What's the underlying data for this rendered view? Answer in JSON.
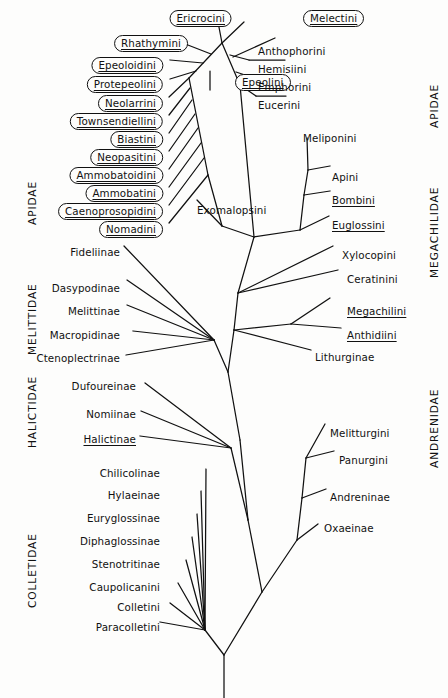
{
  "figure": {
    "type": "cladogram",
    "note": "Boxed names are cleptoparasitic / socially parasitic taxa; underlined names are taxa with social behaviour."
  },
  "families": {
    "left": [
      {
        "name": "APIDAE",
        "x": 26,
        "y": 225
      },
      {
        "name": "MELITTIDAE",
        "x": 26,
        "y": 355
      },
      {
        "name": "HALICTIDAE",
        "x": 26,
        "y": 448
      },
      {
        "name": "COLLETIDAE",
        "x": 26,
        "y": 608
      }
    ],
    "right": [
      {
        "name": "APIDAE",
        "x": 428,
        "y": 128
      },
      {
        "name": "MEGACHILIDAE",
        "x": 428,
        "y": 278
      },
      {
        "name": "ANDRENIDAE",
        "x": 428,
        "y": 468
      }
    ]
  },
  "boxed_taxa": [
    {
      "label": "Ericrocini",
      "x": 232,
      "y": 10,
      "underlined": true
    },
    {
      "label": "Melectini",
      "x": 303,
      "y": 10,
      "underlined": true,
      "align": "left"
    },
    {
      "label": "Rhathymini",
      "x": 188,
      "y": 35,
      "underlined": true
    },
    {
      "label": "Epeoloidini",
      "x": 163,
      "y": 57,
      "underlined": true
    },
    {
      "label": "Protepeolini",
      "x": 163,
      "y": 76,
      "underlined": true
    },
    {
      "label": "Epeolini",
      "x": 235,
      "y": 74,
      "underlined": true,
      "align": "left"
    },
    {
      "label": "Neolarrini",
      "x": 163,
      "y": 95,
      "underlined": true
    },
    {
      "label": "Townsendiellini",
      "x": 163,
      "y": 113,
      "underlined": true
    },
    {
      "label": "Biastini",
      "x": 163,
      "y": 131,
      "underlined": true
    },
    {
      "label": "Neopasitini",
      "x": 163,
      "y": 149,
      "underlined": true
    },
    {
      "label": "Ammobatoidini",
      "x": 163,
      "y": 167,
      "underlined": true
    },
    {
      "label": "Ammobatini",
      "x": 163,
      "y": 185,
      "underlined": true
    },
    {
      "label": "Caenoprosopidini",
      "x": 163,
      "y": 203,
      "underlined": true
    },
    {
      "label": "Nomadini",
      "x": 163,
      "y": 221,
      "underlined": true
    }
  ],
  "plain_taxa": [
    {
      "label": "Anthophorini",
      "x": 258,
      "y": 46,
      "align": "left",
      "underlined": false
    },
    {
      "label": "Hemisiini",
      "x": 258,
      "y": 64,
      "align": "left",
      "underlined": false
    },
    {
      "label": "Emphorini",
      "x": 258,
      "y": 82,
      "align": "left",
      "underlined": false
    },
    {
      "label": "Eucerini",
      "x": 258,
      "y": 100,
      "align": "left",
      "underlined": false
    },
    {
      "label": "Meliponini",
      "x": 303,
      "y": 133,
      "align": "left",
      "underlined": false
    },
    {
      "label": "Apini",
      "x": 332,
      "y": 172,
      "align": "left",
      "underlined": false
    },
    {
      "label": "Bombini",
      "x": 332,
      "y": 195,
      "align": "left",
      "underlined": true
    },
    {
      "label": "Euglossini",
      "x": 332,
      "y": 220,
      "align": "left",
      "underlined": true
    },
    {
      "label": "Exomalopsini",
      "x": 197,
      "y": 205,
      "align": "left",
      "underlined": false
    },
    {
      "label": "Xylocopini",
      "x": 342,
      "y": 250,
      "align": "left",
      "underlined": false
    },
    {
      "label": "Ceratinini",
      "x": 347,
      "y": 274,
      "align": "left",
      "underlined": false
    },
    {
      "label": "Megachilini",
      "x": 347,
      "y": 306,
      "align": "left",
      "underlined": true
    },
    {
      "label": "Anthidiini",
      "x": 347,
      "y": 330,
      "align": "left",
      "underlined": true
    },
    {
      "label": "Lithurginae",
      "x": 315,
      "y": 352,
      "align": "left",
      "underlined": false
    },
    {
      "label": "Fideliinae",
      "x": 120,
      "y": 247,
      "align": "right",
      "underlined": false
    },
    {
      "label": "Dasypodinae",
      "x": 120,
      "y": 283,
      "align": "right",
      "underlined": false
    },
    {
      "label": "Melittinae",
      "x": 120,
      "y": 306,
      "align": "right",
      "underlined": false
    },
    {
      "label": "Macropidinae",
      "x": 120,
      "y": 330,
      "align": "right",
      "underlined": false
    },
    {
      "label": "Ctenoplectrinae",
      "x": 120,
      "y": 353,
      "align": "right",
      "underlined": false
    },
    {
      "label": "Dufoureinae",
      "x": 136,
      "y": 381,
      "align": "right",
      "underlined": false
    },
    {
      "label": "Nomiinae",
      "x": 136,
      "y": 409,
      "align": "right",
      "underlined": false
    },
    {
      "label": "Halictinae",
      "x": 136,
      "y": 434,
      "align": "right",
      "underlined": true
    },
    {
      "label": "Chilicolinae",
      "x": 160,
      "y": 468,
      "align": "right",
      "underlined": false
    },
    {
      "label": "Hylaeinae",
      "x": 160,
      "y": 490,
      "align": "right",
      "underlined": false
    },
    {
      "label": "Euryglossinae",
      "x": 160,
      "y": 513,
      "align": "right",
      "underlined": false
    },
    {
      "label": "Diphaglossinae",
      "x": 160,
      "y": 536,
      "align": "right",
      "underlined": false
    },
    {
      "label": "Stenotritinae",
      "x": 160,
      "y": 559,
      "align": "right",
      "underlined": false
    },
    {
      "label": "Caupolicanini",
      "x": 160,
      "y": 582,
      "align": "right",
      "underlined": false
    },
    {
      "label": "Colletini",
      "x": 160,
      "y": 602,
      "align": "right",
      "underlined": false
    },
    {
      "label": "Paracolletini",
      "x": 160,
      "y": 622,
      "align": "right",
      "underlined": false
    },
    {
      "label": "Melitturgini",
      "x": 330,
      "y": 428,
      "align": "left",
      "underlined": false
    },
    {
      "label": "Panurgini",
      "x": 339,
      "y": 455,
      "align": "left",
      "underlined": false
    },
    {
      "label": "Andreninae",
      "x": 330,
      "y": 492,
      "align": "left",
      "underlined": false
    },
    {
      "label": "Oxaeinae",
      "x": 324,
      "y": 523,
      "align": "left",
      "underlined": false
    }
  ],
  "style": {
    "stroke": "#111111",
    "background": "#fdfdfc",
    "line_width": 1.25
  }
}
